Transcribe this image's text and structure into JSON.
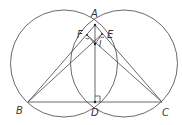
{
  "diagram": {
    "type": "geometry",
    "stroke_color": "#444444",
    "points": {
      "A": {
        "label": "A",
        "x": 95,
        "y": 25
      },
      "B": {
        "label": "B",
        "x": 28,
        "y": 102
      },
      "C": {
        "label": "C",
        "x": 162,
        "y": 102
      },
      "D": {
        "label": "D",
        "x": 95,
        "y": 102
      },
      "E": {
        "label": "E",
        "x": 102,
        "y": 34
      },
      "F": {
        "label": "F",
        "x": 87,
        "y": 35
      },
      "I": {
        "label": "I",
        "x": 95,
        "y": 44
      }
    },
    "labels": {
      "A": "A",
      "B": "B",
      "C": "C",
      "D": "D",
      "E": "E",
      "F": "F",
      "I": "I"
    },
    "circles": [
      {
        "name": "left-circle",
        "cx": 64,
        "cy": 63.5,
        "r": 53.5
      },
      {
        "name": "right-circle",
        "cx": 124,
        "cy": 63.5,
        "r": 53.5
      }
    ],
    "segments": [
      "AB",
      "AC",
      "AD",
      "BC",
      "BE",
      "CF",
      "FI",
      "EI"
    ],
    "right_angle_at": "D"
  }
}
